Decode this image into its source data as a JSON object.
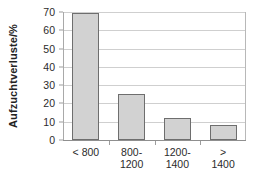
{
  "chart_data": {
    "type": "bar",
    "title": "",
    "xlabel": "",
    "ylabel": "Aufzuchtverluste/%",
    "categories": [
      "< 800",
      "800-\n1200",
      "1200-\n1400",
      ">\n1400"
    ],
    "category_lines": [
      [
        "< 800"
      ],
      [
        "800-",
        "1200"
      ],
      [
        "1200-",
        "1400"
      ],
      [
        ">",
        "1400"
      ]
    ],
    "values": [
      69.5,
      25,
      12,
      8
    ],
    "ylim": [
      0,
      70
    ],
    "yticks": [
      0,
      10,
      20,
      30,
      40,
      50,
      60,
      70
    ],
    "ytick_labels": [
      "0",
      "10",
      "20",
      "30",
      "40",
      "50",
      "60",
      "70"
    ],
    "grid": "horizontal",
    "legend": "none",
    "bar_fill_color": "#d2d2d2",
    "bar_edge_color": "#6e6e6e",
    "gridline_color": "#cfcfcf",
    "axis_color": "#8f8f8f",
    "background_color": "#ffffff"
  }
}
